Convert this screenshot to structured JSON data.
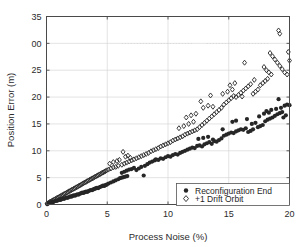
{
  "chart_data": {
    "type": "scatter",
    "title": "",
    "xlabel": "Process Noise (%)",
    "ylabel": "Position Error (m)",
    "xlim": [
      0,
      20
    ],
    "ylim": [
      0,
      35
    ],
    "xticks": [
      0,
      5,
      10,
      15,
      20
    ],
    "yticks": [
      0,
      5,
      10,
      15,
      20,
      25,
      30,
      35
    ],
    "xtick_labels": [
      "0",
      "5",
      "10",
      "15",
      "20"
    ],
    "ytick_labels": [
      "0",
      "5",
      "10",
      "15",
      "20",
      "25",
      "00",
      "35"
    ],
    "grid": true,
    "legend_position": "lower right",
    "series": [
      {
        "name": "Reconfiguration End",
        "marker": "filled-circle",
        "color": "#262626",
        "points": [
          [
            0.05,
            0.1
          ],
          [
            0.15,
            0.2
          ],
          [
            0.25,
            0.3
          ],
          [
            0.35,
            0.35
          ],
          [
            0.45,
            0.5
          ],
          [
            0.55,
            0.45
          ],
          [
            0.65,
            0.6
          ],
          [
            0.75,
            0.7
          ],
          [
            0.85,
            0.65
          ],
          [
            0.95,
            0.8
          ],
          [
            1.05,
            0.9
          ],
          [
            1.15,
            0.85
          ],
          [
            1.25,
            1.0
          ],
          [
            1.35,
            1.1
          ],
          [
            1.45,
            1.05
          ],
          [
            1.55,
            1.2
          ],
          [
            1.65,
            1.3
          ],
          [
            1.75,
            1.25
          ],
          [
            1.85,
            1.4
          ],
          [
            1.95,
            1.5
          ],
          [
            2.05,
            1.45
          ],
          [
            2.15,
            1.6
          ],
          [
            2.25,
            1.7
          ],
          [
            2.35,
            1.65
          ],
          [
            2.45,
            1.8
          ],
          [
            2.55,
            1.9
          ],
          [
            2.65,
            1.85
          ],
          [
            2.75,
            2.0
          ],
          [
            2.85,
            2.1
          ],
          [
            2.95,
            2.2
          ],
          [
            3.05,
            2.15
          ],
          [
            3.15,
            2.3
          ],
          [
            3.25,
            2.4
          ],
          [
            3.35,
            2.35
          ],
          [
            3.45,
            2.5
          ],
          [
            3.55,
            2.6
          ],
          [
            3.65,
            2.7
          ],
          [
            3.75,
            2.65
          ],
          [
            3.85,
            2.8
          ],
          [
            3.95,
            2.9
          ],
          [
            4.05,
            3.0
          ],
          [
            4.15,
            3.1
          ],
          [
            4.25,
            3.05
          ],
          [
            4.35,
            3.2
          ],
          [
            4.45,
            3.3
          ],
          [
            4.55,
            3.4
          ],
          [
            4.65,
            3.5
          ],
          [
            4.75,
            3.45
          ],
          [
            4.85,
            3.6
          ],
          [
            4.95,
            3.7
          ],
          [
            5.1,
            3.9
          ],
          [
            5.3,
            4.1
          ],
          [
            5.5,
            4.3
          ],
          [
            5.7,
            4.5
          ],
          [
            5.9,
            4.7
          ],
          [
            6.05,
            4.9
          ],
          [
            6.2,
            5.0
          ],
          [
            6.35,
            5.1
          ],
          [
            6.5,
            5.2
          ],
          [
            6.65,
            5.3
          ],
          [
            6.2,
            5.9
          ],
          [
            6.4,
            6.1
          ],
          [
            6.6,
            6.3
          ],
          [
            6.8,
            6.5
          ],
          [
            7.0,
            6.6
          ],
          [
            7.2,
            6.8
          ],
          [
            7.4,
            6.4
          ],
          [
            7.6,
            6.7
          ],
          [
            7.8,
            7.0
          ],
          [
            8.0,
            5.4
          ],
          [
            8.1,
            7.2
          ],
          [
            8.3,
            7.5
          ],
          [
            8.5,
            7.8
          ],
          [
            8.7,
            8.0
          ],
          [
            8.9,
            8.2
          ],
          [
            9.0,
            8.4
          ],
          [
            9.2,
            8.3
          ],
          [
            9.4,
            8.6
          ],
          [
            9.6,
            8.5
          ],
          [
            9.8,
            8.8
          ],
          [
            10.0,
            9.0
          ],
          [
            10.2,
            8.9
          ],
          [
            10.4,
            9.2
          ],
          [
            10.6,
            9.4
          ],
          [
            10.8,
            9.3
          ],
          [
            11.0,
            9.6
          ],
          [
            11.2,
            9.8
          ],
          [
            11.4,
            10.0
          ],
          [
            11.6,
            10.2
          ],
          [
            11.8,
            10.4
          ],
          [
            12.0,
            10.6
          ],
          [
            12.2,
            10.5
          ],
          [
            12.4,
            10.9
          ],
          [
            12.6,
            11.0
          ],
          [
            12.8,
            10.8
          ],
          [
            13.0,
            11.2
          ],
          [
            13.2,
            11.4
          ],
          [
            13.4,
            11.6
          ],
          [
            13.6,
            11.3
          ],
          [
            13.8,
            11.8
          ],
          [
            12.5,
            12.2
          ],
          [
            12.9,
            12.4
          ],
          [
            13.3,
            12.6
          ],
          [
            13.7,
            12.1
          ],
          [
            14.0,
            11.7
          ],
          [
            14.2,
            12.0
          ],
          [
            14.4,
            12.3
          ],
          [
            14.6,
            12.8
          ],
          [
            14.8,
            13.0
          ],
          [
            15.0,
            13.2
          ],
          [
            15.2,
            13.4
          ],
          [
            15.4,
            13.3
          ],
          [
            15.6,
            13.6
          ],
          [
            15.8,
            13.8
          ],
          [
            16.0,
            14.0
          ],
          [
            16.2,
            13.9
          ],
          [
            16.4,
            14.2
          ],
          [
            16.6,
            13.5
          ],
          [
            16.8,
            13.7
          ],
          [
            17.0,
            14.0
          ],
          [
            15.3,
            15.4
          ],
          [
            15.6,
            15.6
          ],
          [
            16.9,
            15.0
          ],
          [
            17.2,
            15.2
          ],
          [
            17.4,
            14.4
          ],
          [
            17.6,
            14.6
          ],
          [
            17.8,
            14.8
          ],
          [
            18.0,
            15.5
          ],
          [
            18.2,
            15.8
          ],
          [
            18.4,
            16.0
          ],
          [
            18.6,
            16.2
          ],
          [
            18.8,
            16.5
          ],
          [
            19.0,
            16.8
          ],
          [
            19.2,
            17.0
          ],
          [
            19.4,
            17.2
          ],
          [
            18.1,
            17.4
          ],
          [
            18.5,
            17.6
          ],
          [
            18.9,
            17.8
          ],
          [
            19.3,
            18.0
          ],
          [
            19.6,
            18.4
          ],
          [
            19.8,
            18.6
          ],
          [
            20.0,
            18.5
          ],
          [
            19.1,
            19.6
          ],
          [
            18.3,
            17.1
          ],
          [
            17.5,
            16.4
          ],
          [
            19.5,
            16.2
          ],
          [
            19.7,
            16.6
          ],
          [
            17.9,
            16.9
          ],
          [
            16.5,
            15.9
          ],
          [
            14.5,
            14.0
          ]
        ]
      },
      {
        "name": "+1 Drift Orbit",
        "marker": "open-diamond",
        "color": "#262626",
        "points": [
          [
            0.05,
            0.15
          ],
          [
            0.15,
            0.3
          ],
          [
            0.25,
            0.45
          ],
          [
            0.35,
            0.55
          ],
          [
            0.45,
            0.7
          ],
          [
            0.55,
            0.8
          ],
          [
            0.65,
            0.95
          ],
          [
            0.75,
            1.05
          ],
          [
            0.85,
            1.2
          ],
          [
            0.95,
            1.3
          ],
          [
            1.05,
            1.45
          ],
          [
            1.15,
            1.55
          ],
          [
            1.25,
            1.7
          ],
          [
            1.35,
            1.8
          ],
          [
            1.45,
            1.95
          ],
          [
            1.55,
            2.05
          ],
          [
            1.65,
            2.2
          ],
          [
            1.75,
            2.3
          ],
          [
            1.85,
            2.45
          ],
          [
            1.95,
            2.55
          ],
          [
            2.05,
            2.7
          ],
          [
            2.15,
            2.8
          ],
          [
            2.25,
            2.95
          ],
          [
            2.35,
            3.05
          ],
          [
            2.45,
            3.2
          ],
          [
            2.55,
            3.3
          ],
          [
            2.65,
            3.45
          ],
          [
            2.75,
            3.55
          ],
          [
            2.85,
            3.7
          ],
          [
            2.95,
            3.85
          ],
          [
            3.05,
            3.95
          ],
          [
            3.15,
            4.1
          ],
          [
            3.25,
            4.2
          ],
          [
            3.35,
            4.35
          ],
          [
            3.45,
            4.45
          ],
          [
            3.55,
            4.6
          ],
          [
            3.65,
            4.7
          ],
          [
            3.75,
            4.85
          ],
          [
            3.85,
            4.95
          ],
          [
            3.95,
            5.1
          ],
          [
            4.05,
            5.2
          ],
          [
            4.15,
            5.35
          ],
          [
            4.25,
            5.45
          ],
          [
            4.35,
            5.6
          ],
          [
            4.45,
            5.7
          ],
          [
            4.55,
            5.85
          ],
          [
            4.65,
            5.95
          ],
          [
            4.75,
            6.1
          ],
          [
            4.85,
            6.2
          ],
          [
            4.95,
            6.35
          ],
          [
            5.1,
            6.5
          ],
          [
            5.3,
            6.7
          ],
          [
            5.5,
            6.9
          ],
          [
            5.7,
            7.0
          ],
          [
            5.9,
            7.2
          ],
          [
            5.2,
            7.6
          ],
          [
            5.5,
            7.9
          ],
          [
            5.8,
            8.1
          ],
          [
            6.0,
            8.3
          ],
          [
            6.2,
            7.4
          ],
          [
            6.4,
            7.6
          ],
          [
            6.6,
            7.8
          ],
          [
            6.8,
            8.0
          ],
          [
            7.0,
            8.2
          ],
          [
            6.5,
            8.9
          ],
          [
            6.7,
            9.1
          ],
          [
            6.9,
            8.7
          ],
          [
            7.2,
            8.4
          ],
          [
            7.4,
            8.6
          ],
          [
            7.6,
            8.8
          ],
          [
            7.8,
            9.0
          ],
          [
            8.0,
            9.2
          ],
          [
            6.3,
            9.8
          ],
          [
            8.2,
            9.4
          ],
          [
            8.4,
            9.6
          ],
          [
            8.6,
            9.9
          ],
          [
            8.8,
            10.1
          ],
          [
            9.0,
            10.3
          ],
          [
            9.2,
            10.5
          ],
          [
            9.4,
            10.8
          ],
          [
            9.6,
            11.0
          ],
          [
            9.8,
            11.2
          ],
          [
            10.0,
            11.4
          ],
          [
            10.2,
            11.6
          ],
          [
            10.4,
            11.9
          ],
          [
            10.6,
            12.1
          ],
          [
            10.8,
            12.3
          ],
          [
            11.0,
            12.5
          ],
          [
            11.2,
            12.7
          ],
          [
            11.4,
            13.0
          ],
          [
            11.6,
            13.2
          ],
          [
            11.8,
            13.4
          ],
          [
            12.0,
            13.6
          ],
          [
            12.2,
            13.8
          ],
          [
            12.4,
            14.0
          ],
          [
            10.9,
            14.2
          ],
          [
            11.3,
            14.6
          ],
          [
            11.7,
            15.0
          ],
          [
            12.1,
            15.4
          ],
          [
            11.5,
            16.2
          ],
          [
            11.9,
            16.6
          ],
          [
            12.3,
            16.9
          ],
          [
            12.6,
            14.4
          ],
          [
            12.8,
            14.8
          ],
          [
            13.0,
            15.2
          ],
          [
            13.2,
            15.6
          ],
          [
            13.4,
            16.0
          ],
          [
            13.6,
            16.4
          ],
          [
            13.8,
            16.8
          ],
          [
            14.0,
            17.2
          ],
          [
            12.9,
            18.0
          ],
          [
            13.3,
            18.4
          ],
          [
            13.7,
            18.2
          ],
          [
            14.2,
            17.6
          ],
          [
            14.4,
            18.0
          ],
          [
            14.6,
            18.6
          ],
          [
            14.8,
            19.0
          ],
          [
            15.0,
            19.4
          ],
          [
            15.2,
            19.8
          ],
          [
            15.4,
            20.2
          ],
          [
            14.5,
            20.6
          ],
          [
            14.9,
            21.0
          ],
          [
            15.3,
            21.4
          ],
          [
            15.6,
            20.0
          ],
          [
            15.8,
            20.4
          ],
          [
            16.0,
            20.8
          ],
          [
            16.2,
            21.2
          ],
          [
            16.4,
            21.6
          ],
          [
            16.6,
            22.0
          ],
          [
            16.8,
            22.4
          ],
          [
            15.1,
            22.2
          ],
          [
            15.5,
            22.6
          ],
          [
            16.1,
            20.1
          ],
          [
            17.0,
            20.6
          ],
          [
            17.2,
            21.0
          ],
          [
            17.4,
            21.4
          ],
          [
            17.6,
            22.2
          ],
          [
            17.8,
            22.6
          ],
          [
            18.0,
            23.0
          ],
          [
            18.2,
            23.4
          ],
          [
            16.3,
            26.4
          ],
          [
            17.9,
            25.6
          ],
          [
            18.1,
            25.0
          ],
          [
            18.3,
            24.6
          ],
          [
            18.5,
            24.2
          ],
          [
            18.4,
            28.2
          ],
          [
            18.6,
            27.6
          ],
          [
            18.8,
            27.0
          ],
          [
            19.0,
            26.4
          ],
          [
            19.2,
            25.8
          ],
          [
            19.4,
            25.2
          ],
          [
            19.6,
            24.6
          ],
          [
            19.8,
            24.2
          ],
          [
            20.0,
            26.8
          ],
          [
            19.9,
            28.4
          ],
          [
            19.1,
            32.4
          ],
          [
            19.2,
            31.8
          ],
          [
            13.5,
            20.3
          ],
          [
            12.7,
            19.2
          ],
          [
            17.1,
            23.2
          ]
        ]
      }
    ],
    "legend_entries": [
      {
        "label": "Reconfiguration End",
        "marker": "filled-circle"
      },
      {
        "label": "+1 Drift Orbit",
        "marker": "open-diamond"
      }
    ]
  },
  "colors": {
    "background": "#ffffff",
    "axis": "#4a4a4a",
    "grid": "#d0d0d0",
    "marker": "#262626",
    "text": "#2b2b2b"
  }
}
